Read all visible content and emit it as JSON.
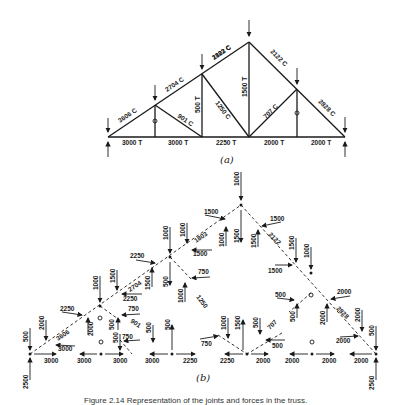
{
  "figure": {
    "caption": "Figure 2.14 Representation of the joints and forces in the truss.",
    "part_a_label": "(a)",
    "part_b_label": "(b)"
  },
  "truss_a": {
    "members": {
      "bottom_1": "3000 T",
      "bottom_2": "3000 T",
      "bottom_3": "2250 T",
      "bottom_4": "2000 T",
      "bottom_5": "2000 T",
      "top_left_1": "3606 C",
      "top_left_2": "2704 C",
      "top_left_3": "1803 C",
      "top_right_1": "2122 C",
      "top_right_2": "2828 C",
      "diag_1": "901 C",
      "vert_2": "500 T",
      "diag_2": "1250 C",
      "vert_center": "1500 T",
      "diag_3": "707 C",
      "zero_left": "0",
      "zero_right": "0"
    }
  },
  "joints_b": {
    "j1": {
      "load": "500",
      "reaction": "2500",
      "bottom": "3000",
      "top_member": "3606"
    },
    "j2": {
      "load": "2000",
      "left": "3000",
      "bottom": "3000",
      "zero": "0",
      "top_member": "2704"
    },
    "j3": {
      "load": "1000",
      "load2": "1500",
      "left": "2250",
      "right": "2250",
      "member_v": "2000",
      "member_diag": "500",
      "f750": "750",
      "f901": "901"
    },
    "j4": {
      "load": "1000",
      "load2": "1000",
      "left": "2250",
      "right": "1500",
      "v1": "1500",
      "v2": "500",
      "f750": "750",
      "member_diag": "1250",
      "top_member": "1803"
    },
    "j5": {
      "load": "1000",
      "left": "1500",
      "right": "1500",
      "v1": "1000",
      "v2": "1500",
      "v3": "1500",
      "top_member": "2122"
    },
    "j6": {
      "load": "1500",
      "load2": "1000",
      "left": "1500",
      "f500": "500",
      "f2000": "2000",
      "v1": "500",
      "v2": "2000",
      "member_diag": "707",
      "top_member": "2828"
    },
    "j7": {
      "load": "2000",
      "left": "2000",
      "load_end": "500",
      "reaction": "2500",
      "bottom": "2000"
    },
    "bottom_row": {
      "b1": "3000",
      "b2": "3000",
      "b3": "3000",
      "b4": "3000",
      "b5": "2250",
      "b6": "2250",
      "b7": "2000",
      "b8": "2000",
      "b9": "2000",
      "b10": "2000",
      "v750_l": "750",
      "v500_a": "500",
      "v500_b": "500",
      "v1000": "1000",
      "v1500": "1500",
      "v500_c": "500",
      "f500_r": "500",
      "f750_b": "750"
    }
  }
}
